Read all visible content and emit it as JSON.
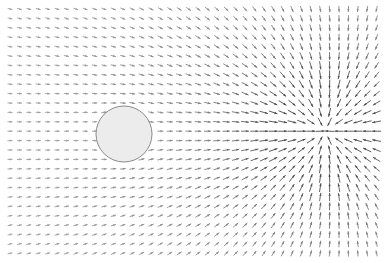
{
  "figure": {
    "title": "",
    "width": 384,
    "height": 263,
    "background_color": "#ffffff"
  },
  "chart_data": {
    "type": "quiver",
    "title": "",
    "subtitle": "",
    "xlabel": "",
    "ylabel": "",
    "grid": false,
    "legend": null,
    "axes_visible": false,
    "tick_labels_x": [],
    "tick_labels_y": [],
    "field_model": {
      "uniform_stream": {
        "u": 1.0,
        "v": 0.0
      },
      "circle_obstacle": {
        "center_px": [
          124,
          134
        ],
        "radius_px": 28,
        "role": "solid-cylinder-dipole",
        "dipole_strength": 1.0,
        "fill_color": "#ececec",
        "stroke_color": "#8a8a8a",
        "stroke_width_px": 1.0
      },
      "point_singularity": {
        "center_px": [
          325,
          131
        ],
        "role": "sink-saddle",
        "strength": -0.55
      }
    },
    "grid_spec": {
      "x_start_px": 10,
      "x_end_px": 377,
      "y_start_px": 9,
      "y_end_px": 254,
      "spacing_px": 9.4,
      "n_cols": 40,
      "n_rows": 27
    },
    "arrow_style": {
      "color_min": "#cfcfcf",
      "color_max": "#4a4a4a",
      "max_length_px": 9.0,
      "min_length_px": 1.5,
      "head_length_px": 3.0,
      "head_width_px": 2.2,
      "line_width_px": 0.9
    }
  },
  "annotations": []
}
